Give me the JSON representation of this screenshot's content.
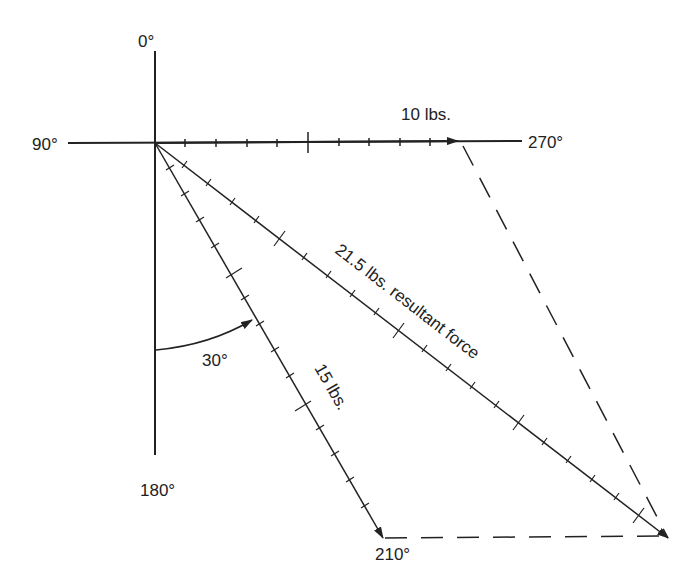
{
  "diagram": {
    "axis_labels": {
      "top": "0°",
      "left": "90°",
      "right": "270°",
      "bottom": "180°"
    },
    "vectors": [
      {
        "label": "10 lbs.",
        "magnitude": 10,
        "direction_deg": 270
      },
      {
        "label": "15 lbs.",
        "magnitude": 15,
        "direction_deg": 210
      },
      {
        "label": "21.5 lbs. resultant force",
        "magnitude": 21.5
      }
    ],
    "angle_label": "30°",
    "endpoint_label": "210°",
    "colors": {
      "line": "#222222",
      "background": "#ffffff"
    }
  }
}
